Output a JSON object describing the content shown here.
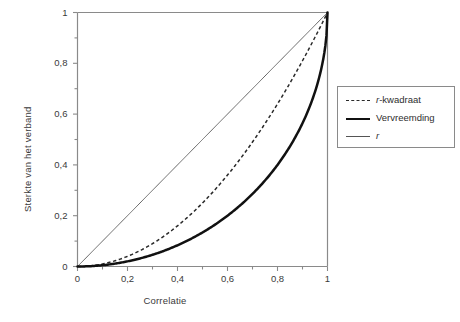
{
  "chart_data": {
    "type": "line",
    "title": "",
    "xlabel": "Correlatie",
    "ylabel": "Sterkte van het verband",
    "xlim": [
      0,
      1
    ],
    "ylim": [
      0,
      1
    ],
    "grid": false,
    "legend_position": "right",
    "xticks": [
      "0",
      "0,2",
      "0,4",
      "0,6",
      "0,8",
      "1"
    ],
    "xtick_values": [
      0,
      0.2,
      0.4,
      0.6,
      0.8,
      1
    ],
    "yticks": [
      "0",
      "0,2",
      "0,4",
      "0,6",
      "0,8",
      "1"
    ],
    "ytick_values": [
      0,
      0.2,
      0.4,
      0.6,
      0.8,
      1
    ],
    "minor_tick_step": 0.1,
    "x": [
      0,
      0.1,
      0.2,
      0.3,
      0.4,
      0.5,
      0.6,
      0.7,
      0.8,
      0.9,
      1
    ],
    "series": [
      {
        "name": "r-kwadraat",
        "style": "dashed",
        "color": "#2a2a2a",
        "values": [
          0,
          0.01,
          0.04,
          0.09,
          0.16,
          0.25,
          0.36,
          0.49,
          0.64,
          0.81,
          1
        ]
      },
      {
        "name": "Vervreemding",
        "style": "thick-solid",
        "color": "#111111",
        "values": [
          0,
          0.005,
          0.02,
          0.046,
          0.083,
          0.134,
          0.2,
          0.286,
          0.4,
          0.564,
          1
        ]
      },
      {
        "name": "r",
        "style": "thin-solid",
        "color": "#555555",
        "values": [
          0,
          0.1,
          0.2,
          0.3,
          0.4,
          0.5,
          0.6,
          0.7,
          0.8,
          0.9,
          1
        ]
      }
    ],
    "legend_entries": [
      {
        "label": "r-kwadraat",
        "label_italic_prefix": "r",
        "label_rest": "-kwadraat",
        "style": "dashed"
      },
      {
        "label": "Vervreemding",
        "label_italic_prefix": "",
        "label_rest": "Vervreemding",
        "style": "thick-solid"
      },
      {
        "label": "r",
        "label_italic_prefix": "r",
        "label_rest": "",
        "style": "thin-solid"
      }
    ]
  },
  "axes": {
    "x_title": "Correlatie",
    "y_title": "Sterkte van het verband",
    "x_tick_labels": [
      "0",
      "0,2",
      "0,4",
      "0,6",
      "0,8",
      "1"
    ],
    "y_tick_labels": [
      "0",
      "0,2",
      "0,4",
      "0,6",
      "0,8",
      "1"
    ]
  },
  "legend": {
    "items": [
      {
        "label_italic": "r",
        "label_plain": "-kwadraat"
      },
      {
        "label_italic": "",
        "label_plain": "Vervreemding"
      },
      {
        "label_italic": "r",
        "label_plain": ""
      }
    ]
  },
  "colors": {
    "frame": "#8a8a8a",
    "thin_line": "#555555",
    "thick_line": "#111111",
    "dashed_line": "#2a2a2a",
    "text": "#3a3a3a",
    "background": "#ffffff"
  }
}
